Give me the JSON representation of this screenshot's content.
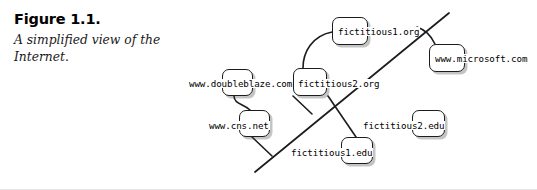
{
  "figure": {
    "number": "Figure 1.1.",
    "caption": "A simplified view of the Internet."
  },
  "diagram": {
    "colors": {
      "node_fill": "#ffffff",
      "node_stroke": "#1c1c1c",
      "shadow": "#3c3c3c",
      "line": "#1c1c1c",
      "text": "#000000",
      "page_background": "#ffffff"
    },
    "nodes": [
      {
        "id": "fictitious1-org",
        "label": "fictitious1.org",
        "box": {
          "x": 332,
          "y": 17,
          "w": 36,
          "h": 28
        },
        "label_pos": {
          "x": 337,
          "y": 27
        }
      },
      {
        "id": "www-microsoft-com",
        "label": "www.microsoft.com",
        "box": {
          "x": 429,
          "y": 44,
          "w": 36,
          "h": 28
        },
        "label_pos": {
          "x": 434,
          "y": 54
        }
      },
      {
        "id": "www-doubleblaze-com",
        "label": "www.doubleblaze.com",
        "box": {
          "x": 222,
          "y": 69,
          "w": 31,
          "h": 27
        },
        "label_pos": {
          "x": 188,
          "y": 79
        }
      },
      {
        "id": "fictitious2-org",
        "label": "fictitious2.org",
        "box": {
          "x": 293,
          "y": 68,
          "w": 34,
          "h": 28
        },
        "label_pos": {
          "x": 297,
          "y": 79
        }
      },
      {
        "id": "www-cns-net",
        "label": "www.cns.net",
        "box": {
          "x": 239,
          "y": 110,
          "w": 31,
          "h": 27
        },
        "label_pos": {
          "x": 208,
          "y": 121
        }
      },
      {
        "id": "fictitious2-edu",
        "label": "fictitious2.edu",
        "box": {
          "x": 412,
          "y": 110,
          "w": 33,
          "h": 27
        },
        "label_pos": {
          "x": 362,
          "y": 121
        }
      },
      {
        "id": "fictitious1-edu",
        "label": "fictitious1.edu",
        "box": {
          "x": 341,
          "y": 137,
          "w": 32,
          "h": 27
        },
        "label_pos": {
          "x": 290,
          "y": 148
        }
      }
    ],
    "backbone": {
      "id": "internet-backbone-line",
      "from": {
        "x": 255,
        "y": 172
      },
      "to": {
        "x": 449,
        "y": 13
      }
    },
    "links": [
      {
        "id": "link-fictitious2org-to-fictitious1org",
        "path": "M 303 68 C 303 52, 312 36, 332 32"
      },
      {
        "id": "link-doubleblaze-to-cns",
        "path": "M 234 96 C 234 104, 244 104, 250 110"
      },
      {
        "id": "link-cns-to-backbone",
        "path": "M 252 137 L 272 156"
      },
      {
        "id": "link-fictitious2org-to-backbone",
        "path": "M 293 96 L 312 114"
      },
      {
        "id": "link-fictitious2org-to-fictitious1edu",
        "path": "M 328 96 L 356 137"
      },
      {
        "id": "link-microsoft-to-backbone",
        "path": "M 435 44 C 430 34, 425 30, 417 27"
      }
    ]
  }
}
